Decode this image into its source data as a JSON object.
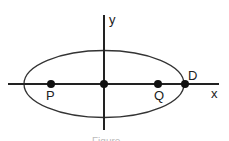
{
  "diagram": {
    "type": "ellipse-on-axes",
    "axes": {
      "x_label": "x",
      "y_label": "y"
    },
    "ellipse": {
      "center": "origin",
      "major_axis": "x"
    },
    "points": [
      {
        "name": "P",
        "label": "P",
        "position": "left focus on x-axis"
      },
      {
        "name": "O",
        "label": "",
        "position": "origin"
      },
      {
        "name": "Q",
        "label": "Q",
        "position": "right focus on x-axis"
      },
      {
        "name": "D",
        "label": "D",
        "position": "right vertex of ellipse on x-axis"
      }
    ],
    "caption": "Figure"
  }
}
